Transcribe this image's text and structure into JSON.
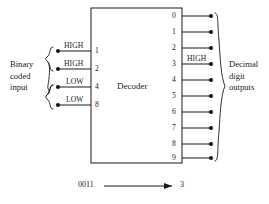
{
  "figure": {
    "type": "logic-block-diagram",
    "background_color": "#ffffff",
    "line_color": "#1a1a1a",
    "block": {
      "title": "Decoder",
      "x": 91,
      "y": 8,
      "width": 91,
      "height": 155
    }
  },
  "left_group": {
    "label_lines": [
      "Binary",
      "coded",
      "input"
    ],
    "brace": "{",
    "inputs": [
      {
        "signal": "HIGH",
        "pin": "1",
        "y": 51
      },
      {
        "signal": "HIGH",
        "pin": "2",
        "y": 69
      },
      {
        "signal": "LOW",
        "pin": "4",
        "y": 87
      },
      {
        "signal": "LOW",
        "pin": "8",
        "y": 105
      }
    ]
  },
  "right_group": {
    "label_lines": [
      "Decimal",
      "digit",
      "outputs"
    ],
    "brace": "}",
    "active_output": "3",
    "active_signal": "HIGH",
    "outputs": [
      {
        "digit": "0",
        "y": 16
      },
      {
        "digit": "1",
        "y": 32
      },
      {
        "digit": "2",
        "y": 48
      },
      {
        "digit": "3",
        "y": 64
      },
      {
        "digit": "4",
        "y": 80
      },
      {
        "digit": "5",
        "y": 96
      },
      {
        "digit": "6",
        "y": 112
      },
      {
        "digit": "7",
        "y": 128
      },
      {
        "digit": "8",
        "y": 144
      },
      {
        "digit": "9",
        "y": 158
      }
    ]
  },
  "caption": {
    "input_code": "0011",
    "arrow": "→",
    "output_digit": "3"
  }
}
